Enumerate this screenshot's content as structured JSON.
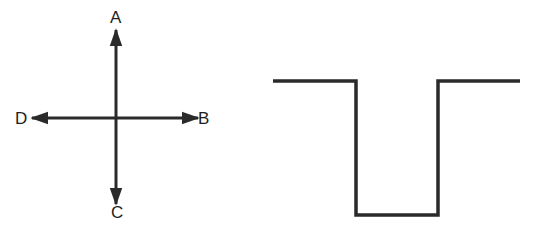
{
  "diagram": {
    "cross": {
      "labels": {
        "top": "A",
        "right": "B",
        "bottom": "C",
        "left": "D"
      },
      "center": [
        116,
        118
      ],
      "arrow_endpoints": {
        "A": [
          116,
          30
        ],
        "B": [
          198,
          118
        ],
        "C": [
          116,
          204
        ],
        "D": [
          32,
          118
        ]
      }
    },
    "well_profile": {
      "points": [
        [
          273,
          81
        ],
        [
          356,
          81
        ],
        [
          356,
          215
        ],
        [
          438,
          215
        ],
        [
          438,
          81
        ],
        [
          520,
          81
        ]
      ]
    },
    "stroke_color": "#2a2a2a",
    "background_color": "#ffffff"
  }
}
